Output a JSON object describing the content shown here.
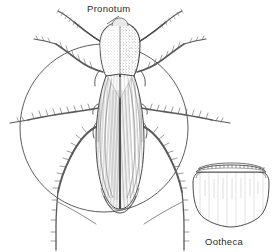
{
  "figure": {
    "type": "scientific-illustration",
    "background_color": "#ffffff",
    "ink_color": "#3a3a3a",
    "labels": {
      "pronotum": "Pronotum",
      "ootheca": "Ootheca"
    },
    "parts": {
      "circle_frame": "circular-outline",
      "pronotum": "pronotum-shield",
      "wings": "forewings-tegmina",
      "antennae": "antennae-pair",
      "legs": "six-spined-legs",
      "ootheca": "egg-case-purse-shape",
      "ootheca_keel": "serrated-keel-ridge"
    }
  }
}
